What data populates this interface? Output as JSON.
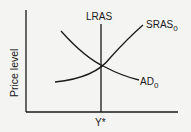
{
  "diagram": {
    "y_axis_label": "Price level",
    "x_tick_label": "Y*",
    "curves": {
      "lras": {
        "label": "LRAS"
      },
      "sras": {
        "label": "SRAS",
        "subscript": "0"
      },
      "ad": {
        "label": "AD",
        "subscript": "0"
      }
    },
    "colors": {
      "line": "#1a1a1a",
      "background": "#f4f4f2"
    }
  }
}
